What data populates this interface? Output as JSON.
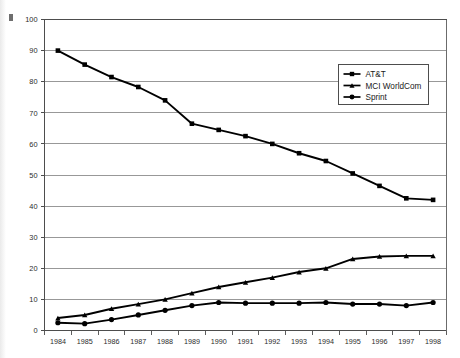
{
  "chart_data": {
    "type": "line",
    "title": "",
    "subtitle": "",
    "xlabel": "",
    "ylabel": "",
    "xlim": [
      1984,
      1998
    ],
    "ylim": [
      0,
      100
    ],
    "ytick_step": 10,
    "grid": "horizontal",
    "legend_position": "top-right",
    "categories": [
      "1984",
      "1985",
      "1986",
      "1987",
      "1988",
      "1989",
      "1990",
      "1991",
      "1992",
      "1993",
      "1994",
      "1995",
      "1996",
      "1997",
      "1998"
    ],
    "yticks": [
      "0",
      "10",
      "20",
      "30",
      "40",
      "50",
      "60",
      "70",
      "80",
      "90",
      "100"
    ],
    "series": [
      {
        "name": "AT&T",
        "marker": "square",
        "color": "#000000",
        "values": [
          90.0,
          85.5,
          81.5,
          78.3,
          74.0,
          66.5,
          64.5,
          62.5,
          60.0,
          57.0,
          54.5,
          50.5,
          46.5,
          42.5,
          42.0
        ]
      },
      {
        "name": "MCI WorldCom",
        "marker": "triangle",
        "color": "#000000",
        "values": [
          4.0,
          5.0,
          7.0,
          8.5,
          10.0,
          12.0,
          14.0,
          15.5,
          17.0,
          18.8,
          20.0,
          23.0,
          23.8,
          24.0,
          24.0
        ]
      },
      {
        "name": "Sprint",
        "marker": "circle",
        "color": "#000000",
        "values": [
          2.5,
          2.2,
          3.5,
          5.0,
          6.5,
          8.0,
          9.0,
          8.8,
          8.8,
          8.8,
          9.0,
          8.5,
          8.5,
          8.0,
          9.0
        ]
      }
    ]
  },
  "legend": {
    "items": [
      {
        "label": "AT&T",
        "marker": "square"
      },
      {
        "label": "MCI WorldCom",
        "marker": "triangle"
      },
      {
        "label": "Sprint",
        "marker": "circle"
      }
    ]
  }
}
